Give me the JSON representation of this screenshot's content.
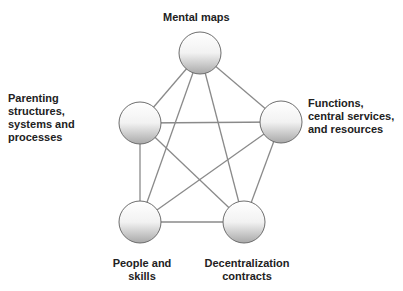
{
  "diagram": {
    "type": "fully-connected pentagon network",
    "nodes": [
      {
        "id": "mental",
        "label_lines": [
          "Mental maps"
        ],
        "cx": 200,
        "cy": 53
      },
      {
        "id": "parenting",
        "label_lines": [
          "Parenting",
          "structures,",
          "systems and",
          "processes"
        ],
        "cx": 140,
        "cy": 123
      },
      {
        "id": "functions",
        "label_lines": [
          "Functions,",
          "central services,",
          "and resources"
        ],
        "cx": 281,
        "cy": 122
      },
      {
        "id": "people",
        "label_lines": [
          "People and",
          "skills"
        ],
        "cx": 140,
        "cy": 222
      },
      {
        "id": "decentral",
        "label_lines": [
          "Decentralization",
          "contracts"
        ],
        "cx": 244,
        "cy": 222
      }
    ],
    "edges": [
      [
        "mental",
        "parenting"
      ],
      [
        "mental",
        "functions"
      ],
      [
        "mental",
        "people"
      ],
      [
        "mental",
        "decentral"
      ],
      [
        "parenting",
        "functions"
      ],
      [
        "parenting",
        "people"
      ],
      [
        "parenting",
        "decentral"
      ],
      [
        "functions",
        "people"
      ],
      [
        "functions",
        "decentral"
      ],
      [
        "people",
        "decentral"
      ]
    ],
    "colors": {
      "edge": "#8a8a8a",
      "node_top": "#ffffff",
      "node_bottom": "#a9a9a9",
      "node_stroke": "#6e6e6e"
    }
  }
}
